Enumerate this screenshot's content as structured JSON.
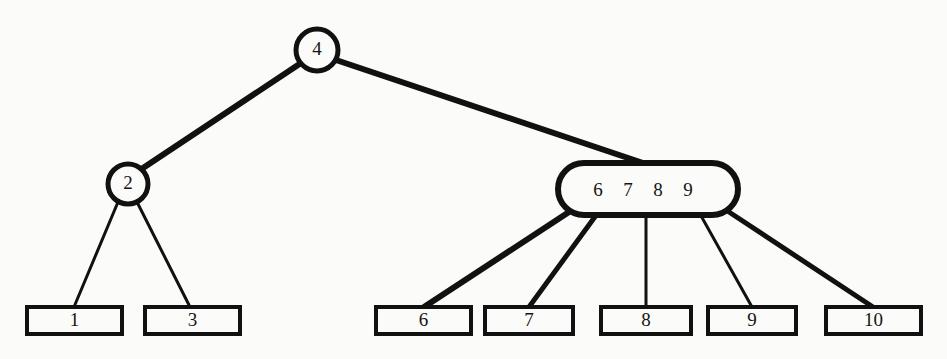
{
  "diagram": {
    "background_color": "#fbfbf9",
    "stroke_color": "#111111",
    "text_color": "#141414",
    "root": {
      "label": "4",
      "shape": "circle",
      "cx": 317,
      "cy": 50,
      "r": 21
    },
    "internal_nodes": [
      {
        "label": "2",
        "shape": "circle",
        "cx": 128,
        "cy": 184,
        "r": 20
      }
    ],
    "multikey_node": {
      "keys": [
        "6",
        "7",
        "8",
        "9"
      ],
      "label": "6 7 8 9",
      "shape": "stadium",
      "x": 558,
      "y": 163,
      "width": 180,
      "height": 52,
      "key_positions": [
        598,
        628,
        658,
        688
      ],
      "text_y": 192
    },
    "leaves": [
      {
        "label": "1",
        "x": 27,
        "y": 307,
        "width": 95,
        "height": 27
      },
      {
        "label": "3",
        "x": 145,
        "y": 307,
        "width": 95,
        "height": 27
      },
      {
        "label": "6",
        "x": 376,
        "y": 307,
        "width": 95,
        "height": 27
      },
      {
        "label": "7",
        "x": 485,
        "y": 307,
        "width": 88,
        "height": 27
      },
      {
        "label": "8",
        "x": 601,
        "y": 307,
        "width": 90,
        "height": 27
      },
      {
        "label": "9",
        "x": 708,
        "y": 307,
        "width": 88,
        "height": 27
      },
      {
        "label": "10",
        "x": 826,
        "y": 307,
        "width": 95,
        "height": 27
      }
    ],
    "edges": [
      {
        "from": "4",
        "to": "2",
        "x1": 301,
        "y1": 63,
        "x2": 140,
        "y2": 170,
        "width": 6
      },
      {
        "from": "4",
        "to": "6 7 8 9",
        "x1": 336,
        "y1": 60,
        "x2": 643,
        "y2": 163,
        "width": 6
      },
      {
        "from": "2",
        "to": "1",
        "x1": 118,
        "y1": 202,
        "x2": 74,
        "y2": 307,
        "width": 3
      },
      {
        "from": "2",
        "to": "3",
        "x1": 137,
        "y1": 202,
        "x2": 190,
        "y2": 307,
        "width": 3
      },
      {
        "from": "6 7 8 9",
        "to": "6",
        "x1": 569,
        "y1": 212,
        "x2": 424,
        "y2": 307,
        "width": 6
      },
      {
        "from": "6 7 8 9",
        "to": "7",
        "x1": 597,
        "y1": 214,
        "x2": 529,
        "y2": 307,
        "width": 5
      },
      {
        "from": "6 7 8 9",
        "to": "8",
        "x1": 646,
        "y1": 214,
        "x2": 646,
        "y2": 307,
        "width": 3
      },
      {
        "from": "6 7 8 9",
        "to": "9",
        "x1": 700,
        "y1": 214,
        "x2": 752,
        "y2": 307,
        "width": 3
      },
      {
        "from": "6 7 8 9",
        "to": "10",
        "x1": 729,
        "y1": 212,
        "x2": 873,
        "y2": 307,
        "width": 5
      }
    ]
  }
}
